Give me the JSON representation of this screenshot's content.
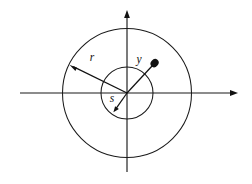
{
  "figure": {
    "background_color": "#ffffff",
    "line_color": "#1a1a1a",
    "label_color": "#111111",
    "width": 252,
    "height": 184,
    "center": {
      "x": 127,
      "y": 93
    },
    "labels": {
      "outer_radius_label": "r",
      "inner_radius_label": "s",
      "point_vector_label": "y"
    },
    "axes": {
      "horizontal": {
        "x_start": 20,
        "x_end": 238,
        "y": 93,
        "arrow": "right"
      },
      "vertical": {
        "y_start": 172,
        "y_end": 10,
        "x": 127,
        "arrow": "up"
      }
    },
    "circles": [
      {
        "name": "outer-circle",
        "cx": 127,
        "cy": 93,
        "r": 64.5
      },
      {
        "name": "inner-circle",
        "cx": 127,
        "cy": 93,
        "r": 26
      }
    ],
    "vectors": [
      {
        "name": "outer-radius-vector",
        "label": "r",
        "from": {
          "x": 127,
          "y": 93
        },
        "to": {
          "x": 70,
          "y": 65
        },
        "head": "arrow",
        "label_pos": {
          "x": 92,
          "y": 58
        }
      },
      {
        "name": "inner-radius-vector",
        "label": "s",
        "from": {
          "x": 127,
          "y": 93
        },
        "to": {
          "x": 113.5,
          "y": 112
        },
        "head": "arrow",
        "label_pos": {
          "x": 112,
          "y": 99
        }
      },
      {
        "name": "point-vector",
        "label": "y",
        "from": {
          "x": 127,
          "y": 93
        },
        "to": {
          "x": 155,
          "y": 63
        },
        "head": "dot",
        "label_pos": {
          "x": 139,
          "y": 60
        }
      }
    ]
  }
}
